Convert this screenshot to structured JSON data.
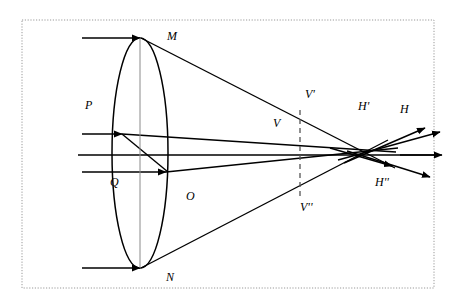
{
  "figure": {
    "type": "optical-ray-diagram",
    "canvas": {
      "width": 458,
      "height": 307,
      "background": "#ffffff"
    },
    "border": {
      "style": "dotted",
      "color": "#999999",
      "x": 22,
      "y": 20,
      "width": 412,
      "height": 268
    },
    "stroke_color": "#000000",
    "lens": {
      "name": "biconvex-lens",
      "center_x": 140,
      "center_y": 153,
      "semi_axis_x": 28,
      "semi_axis_y": 115,
      "axis_line_color": "#8a8a8a"
    },
    "optical_axis": {
      "y": 155,
      "x_start": 78,
      "x_end": 440
    },
    "focal_line": {
      "name": "dashed-focal-line",
      "x": 300,
      "y_top": 110,
      "y_bottom": 196,
      "style": "dashed",
      "color": "#555555"
    },
    "labels": [
      {
        "id": "M",
        "text": "M",
        "x": 167,
        "y": 40
      },
      {
        "id": "P",
        "text": "P",
        "x": 85,
        "y": 109
      },
      {
        "id": "Q",
        "text": "Q",
        "x": 110,
        "y": 186
      },
      {
        "id": "O",
        "text": "O",
        "x": 186,
        "y": 200
      },
      {
        "id": "N",
        "text": "N",
        "x": 166,
        "y": 281
      },
      {
        "id": "V",
        "text": "V",
        "x": 273,
        "y": 127
      },
      {
        "id": "Vp",
        "text": "V'",
        "x": 305,
        "y": 98
      },
      {
        "id": "Vpp",
        "text": "V''",
        "x": 300,
        "y": 211
      },
      {
        "id": "Hp",
        "text": "H'",
        "x": 358,
        "y": 110
      },
      {
        "id": "H",
        "text": "H",
        "x": 400,
        "y": 113
      },
      {
        "id": "Hpp",
        "text": "H''",
        "x": 375,
        "y": 186
      }
    ],
    "incoming_rays": [
      {
        "name": "ray-to-M",
        "x1": 82,
        "y1": 38,
        "x2": 140,
        "y2": 38,
        "arrow": true
      },
      {
        "name": "ray-to-P",
        "x1": 82,
        "y1": 134,
        "x2": 122,
        "y2": 134,
        "arrow": true
      },
      {
        "name": "ray-axis",
        "x1": 78,
        "y1": 155,
        "x2": 140,
        "y2": 155,
        "arrow": false
      },
      {
        "name": "ray-to-Q",
        "x1": 82,
        "y1": 172,
        "x2": 166,
        "y2": 172,
        "arrow": true
      },
      {
        "name": "ray-to-N",
        "x1": 82,
        "y1": 268,
        "x2": 140,
        "y2": 268,
        "arrow": true
      }
    ],
    "refracted_rays": [
      {
        "name": "ray-M-to-Vpp",
        "x1": 141,
        "y1": 38,
        "x2": 395,
        "y2": 168
      },
      {
        "name": "ray-N-to-Vp",
        "x1": 141,
        "y1": 268,
        "x2": 388,
        "y2": 140
      },
      {
        "name": "ray-P-upper",
        "x1": 122,
        "y1": 134,
        "x2": 396,
        "y2": 152
      },
      {
        "name": "ray-P-lower",
        "x1": 122,
        "y1": 134,
        "x2": 168,
        "y2": 172
      },
      {
        "name": "ray-Q-out",
        "x1": 166,
        "y1": 172,
        "x2": 398,
        "y2": 148
      },
      {
        "name": "ray-axis-out",
        "x1": 140,
        "y1": 155,
        "x2": 440,
        "y2": 155
      }
    ],
    "exit_rays": [
      {
        "name": "exit-ray-up-1",
        "x1": 344,
        "y1": 163,
        "x2": 425,
        "y2": 128,
        "arrow": true
      },
      {
        "name": "exit-ray-up-2",
        "x1": 338,
        "y1": 160,
        "x2": 440,
        "y2": 132,
        "arrow": true
      },
      {
        "name": "exit-ray-down-1",
        "x1": 330,
        "y1": 148,
        "x2": 392,
        "y2": 166,
        "arrow": true
      },
      {
        "name": "exit-ray-down-2",
        "x1": 347,
        "y1": 151,
        "x2": 430,
        "y2": 177,
        "arrow": true
      },
      {
        "name": "exit-ray-axis",
        "x1": 400,
        "y1": 155,
        "x2": 442,
        "y2": 155,
        "arrow": true
      }
    ]
  }
}
